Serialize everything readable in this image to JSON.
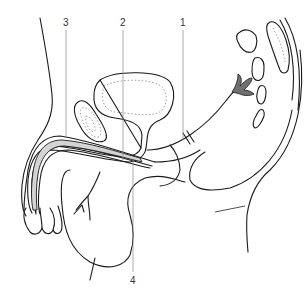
{
  "figure": {
    "background": "#ffffff",
    "line_color": "#1a1a1a",
    "labels": [
      {
        "number": "1",
        "x": 180,
        "y": 18
      },
      {
        "number": "2",
        "x": 120,
        "y": 18
      },
      {
        "number": "3",
        "x": 63,
        "y": 18
      },
      {
        "number": "4",
        "x": 130,
        "y": 276
      }
    ]
  }
}
